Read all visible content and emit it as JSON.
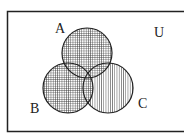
{
  "diagram": {
    "type": "venn",
    "universe_label": "U",
    "sets": [
      {
        "label": "A",
        "cx": 87,
        "cy": 53,
        "r": 25
      },
      {
        "label": "B",
        "cx": 68,
        "cy": 88,
        "r": 25
      },
      {
        "label": "C",
        "cx": 108,
        "cy": 88,
        "r": 25
      }
    ],
    "shading": {
      "A_union_B": "crosshatch",
      "C_only": "vertical-stripes"
    },
    "colors": {
      "line": "#222222",
      "background": "#ffffff"
    }
  }
}
